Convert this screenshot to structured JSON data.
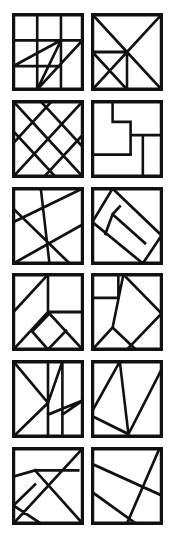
{
  "sheet": {
    "title": "Tangram Dissection Puzzle Grid",
    "caption": "",
    "columns": 2,
    "rows": 6,
    "background_color": "#ffffff",
    "line_color": "#111111",
    "frame_stroke_width": 5,
    "cut_stroke_width": 3.6,
    "panel_count": 12
  },
  "panels": [
    {
      "index": 1,
      "name": "panel-1",
      "label": "1",
      "description": "Three-by-three grid of squares overlaid with a zigzag of long diagonals",
      "viewbox": "0 0 100 100",
      "frame": "M2,2 L98,2 L98,98 L2,98 Z",
      "cuts": "M2,35 L68,35 M2,68 L68,68 M35,2 L35,98 M68,2 L68,98 M2,68 L68,35 M68,35 L98,35 M35,98 L68,35 M35,98 L98,35 M35,98 L35,68"
    },
    {
      "index": 2,
      "name": "panel-2",
      "label": "2",
      "description": "Square with both full diagonals forming an X, a vertical line from center to base, and a small triangle notch on the left edge",
      "viewbox": "0 0 100 100",
      "frame": "M2,2 L98,2 L98,98 L2,98 Z",
      "cuts": "M2,2 L98,98 M98,2 L2,98 M50,50 L50,98 M2,50 L50,98 M2,50 L50,50"
    },
    {
      "index": 3,
      "name": "panel-3",
      "label": "3",
      "description": "Diagonal lattice of parallel lines crossing in both directions forming diamonds",
      "viewbox": "0 0 100 100",
      "frame": "M2,2 L98,2 L98,98 L2,98 Z",
      "cuts": "M2,40 L60,98 M2,2 L98,98 M40,2 L98,60 M2,55 L55,2 M2,98 L98,2 M45,98 L98,45"
    },
    {
      "index": 4,
      "name": "panel-4",
      "label": "4",
      "description": "Rectilinear subdivision of nested rectangles with no diagonal cuts",
      "viewbox": "0 0 100 100",
      "frame": "M2,2 L98,2 L98,98 L2,98 Z",
      "cuts": "M30,2 L30,28 M30,28 L55,28 M55,28 L55,70 M55,70 L2,70 M55,45 L98,45 M72,45 L72,98 M55,45 L55,28"
    },
    {
      "index": 5,
      "name": "panel-5",
      "label": "5",
      "description": "Skewed lattice of two near-parallel diagonals crossed by two diagonals in the opposite direction",
      "viewbox": "0 0 100 100",
      "frame": "M2,2 L98,2 L98,98 L2,98 Z",
      "cuts": "M2,45 L98,2 M2,98 L98,48 M40,2 L52,98 M2,28 L80,98"
    },
    {
      "index": 6,
      "name": "panel-6",
      "label": "6",
      "description": "Tilted parallelogram inscribed in the square with its corners joined to the square's corners",
      "viewbox": "0 0 100 100",
      "frame": "M2,2 L98,2 L98,98 L2,98 Z",
      "cuts": "M30,2 L98,62 M2,45 L72,98 M30,2 L2,45 M98,62 L72,98 M30,35 L75,72 M30,35 L40,25 M30,35 L20,60"
    },
    {
      "index": 7,
      "name": "panel-7",
      "label": "7",
      "description": "Tangram with a diagonal triangle upper-left, a rectangle upper-right and a rhombus in the lower centre",
      "viewbox": "0 0 100 100",
      "frame": "M2,2 L98,2 L98,98 L2,98 Z",
      "cuts": "M2,50 L50,2 M50,2 L50,50 M50,50 L98,50 M2,98 L50,50 M50,50 L98,98 M28,75 L50,98 M50,98 L75,74 M28,75 L52,52"
    },
    {
      "index": 8,
      "name": "panel-8",
      "label": "8",
      "description": "Small square in the upper-left corner with a long diagonal running to the lower-left and branching cuts",
      "viewbox": "0 0 100 100",
      "frame": "M2,2 L98,2 L98,98 L2,98 Z",
      "cuts": "M38,2 L38,32 M2,32 L38,32 M45,2 L98,52 M98,52 L50,98 M45,2 L30,70 M30,70 L2,98 M30,70 L62,98"
    },
    {
      "index": 9,
      "name": "panel-9",
      "label": "9",
      "description": "Vertical divider with a diagonal to centre, a V shape below and a narrow vertical strip on the right",
      "viewbox": "0 0 100 100",
      "frame": "M2,2 L98,2 L98,98 L2,98 Z",
      "cuts": "M50,2 L50,98 M2,2 L50,55 M2,98 L50,55 M50,55 L70,2 M70,2 L70,98 M50,70 L98,52 M70,70 L98,52"
    },
    {
      "index": 10,
      "name": "panel-10",
      "label": "10",
      "description": "Zigzag of long lines converging on a single point at the bottom edge",
      "viewbox": "0 0 100 100",
      "frame": "M2,2 L98,2 L98,98 L2,98 Z",
      "cuts": "M40,2 L2,65 M40,2 L52,95 M2,72 L52,95 M52,95 L98,12"
    },
    {
      "index": 11,
      "name": "panel-11",
      "label": "11",
      "description": "Two crossing diagonals forming an X with a horizontal bar near the top and a small triangle on the left",
      "viewbox": "0 0 100 100",
      "frame": "M2,2 L98,2 L98,98 L2,98 Z",
      "cuts": "M98,2 L2,98 M32,30 L98,98 M32,30 L92,30 M2,38 L32,30 M2,75 L32,48 M2,75 L40,98"
    },
    {
      "index": 12,
      "name": "panel-12",
      "label": "12",
      "description": "Two parallel shallow diagonals crossed by a steeper diagonal running to the bottom edge",
      "viewbox": "0 0 100 100",
      "frame": "M2,2 L98,2 L98,98 L2,98 Z",
      "cuts": "M2,22 L98,62 M2,58 L62,98 M95,2 L50,98"
    }
  ]
}
